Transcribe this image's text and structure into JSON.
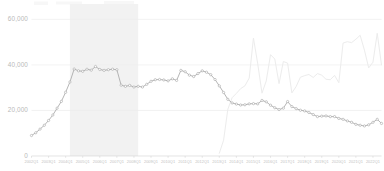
{
  "chart_data": {
    "type": "line",
    "title": "",
    "subtitle": "",
    "xlabel": "",
    "ylabel": "",
    "ylim": [
      0,
      65000
    ],
    "yticks": [
      0,
      20000,
      40000,
      60000
    ],
    "ytick_labels": [
      "0",
      "20,000",
      "40,000",
      "60,000"
    ],
    "grid": true,
    "legend_position": "none",
    "x": [
      "2002Q1",
      "2002Q2",
      "2002Q3",
      "2002Q4",
      "2003Q1",
      "2003Q2",
      "2003Q3",
      "2003Q4",
      "2004Q1",
      "2004Q2",
      "2004Q3",
      "2004Q4",
      "2005Q1",
      "2005Q2",
      "2005Q3",
      "2005Q4",
      "2006Q1",
      "2006Q2",
      "2006Q3",
      "2006Q4",
      "2007Q1",
      "2007Q2",
      "2007Q3",
      "2007Q4",
      "2008Q1",
      "2008Q2",
      "2008Q3",
      "2008Q4",
      "2009Q1",
      "2009Q2",
      "2009Q3",
      "2009Q4",
      "2010Q1",
      "2010Q2",
      "2010Q3",
      "2010Q4",
      "2011Q1",
      "2011Q2",
      "2011Q3",
      "2011Q4",
      "2012Q1",
      "2012Q2",
      "2012Q3",
      "2012Q4",
      "2013Q1",
      "2013Q2",
      "2013Q3",
      "2013Q4",
      "2014Q1",
      "2014Q2",
      "2014Q3",
      "2014Q4",
      "2015Q1",
      "2015Q2",
      "2015Q3",
      "2015Q4",
      "2016Q1",
      "2016Q2",
      "2016Q3",
      "2016Q4",
      "2017Q1",
      "2017Q2",
      "2017Q3",
      "2017Q4",
      "2018Q1",
      "2018Q2",
      "2018Q3",
      "2018Q4",
      "2019Q1",
      "2019Q2",
      "2019Q3",
      "2019Q4",
      "2020Q1",
      "2020Q2",
      "2020Q3",
      "2020Q4",
      "2021Q1",
      "2021Q2",
      "2021Q3",
      "2021Q4",
      "2022Q1",
      "2022Q2",
      "2022Q3"
    ],
    "xtick_labels": [
      "2002Q1",
      "2003Q1",
      "2004Q1",
      "2005Q1",
      "2006Q1",
      "2007Q1",
      "2008Q1",
      "2009Q1",
      "2010Q1",
      "2011Q1",
      "2012Q1",
      "2013Q1",
      "2014Q1",
      "2015Q1",
      "2016Q1",
      "2017Q1",
      "2018Q1",
      "2019Q1",
      "2020Q1",
      "2021Q1",
      "2022Q1"
    ],
    "series": [
      {
        "name": "primary",
        "style": "line-with-markers",
        "color": "#a0a0a0",
        "values": [
          9000,
          10200,
          11800,
          13500,
          15600,
          18000,
          21000,
          24000,
          28000,
          32500,
          38200,
          37400,
          37200,
          38100,
          37700,
          39300,
          38000,
          37600,
          37900,
          38100,
          37900,
          31100,
          30600,
          31000,
          30300,
          30600,
          30300,
          31500,
          32800,
          33500,
          33600,
          33400,
          33000,
          33900,
          33200,
          37600,
          37000,
          35500,
          34900,
          36200,
          37400,
          36800,
          35700,
          33600,
          30800,
          27900,
          24900,
          23300,
          22800,
          22400,
          22500,
          22900,
          23000,
          22900,
          24400,
          23800,
          22300,
          21200,
          20400,
          21000,
          23900,
          21700,
          20800,
          20100,
          19800,
          19100,
          18200,
          17300,
          17500,
          17600,
          17300,
          17300,
          16500,
          16100,
          15400,
          14800,
          13900,
          13500,
          13200,
          13700,
          14800,
          16100,
          14300
        ]
      },
      {
        "name": "secondary",
        "style": "line",
        "color": "#ececec",
        "values": [
          null,
          null,
          null,
          null,
          null,
          null,
          null,
          null,
          null,
          null,
          null,
          null,
          null,
          null,
          null,
          null,
          null,
          null,
          null,
          null,
          null,
          null,
          null,
          null,
          null,
          null,
          null,
          null,
          null,
          null,
          null,
          null,
          null,
          null,
          null,
          null,
          null,
          null,
          null,
          null,
          null,
          null,
          null,
          null,
          1200,
          6900,
          20500,
          25600,
          27500,
          29600,
          30800,
          34200,
          51800,
          40500,
          27600,
          33000,
          44500,
          42600,
          31800,
          41500,
          40800,
          27700,
          30500,
          34600,
          35300,
          35800,
          34500,
          36200,
          35500,
          33700,
          33500,
          35400,
          32200,
          49600,
          50200,
          49800,
          51300,
          53000,
          46500,
          38700,
          41200,
          53900,
          40000
        ]
      }
    ]
  },
  "annotations": {
    "shaded_band": {
      "label": "",
      "start_x": "2004Q2",
      "end_x": "2008Q2",
      "color": "#f2f2f2"
    }
  },
  "axes": {
    "y_axis_name": "y-axis",
    "x_axis_name": "x-axis"
  }
}
